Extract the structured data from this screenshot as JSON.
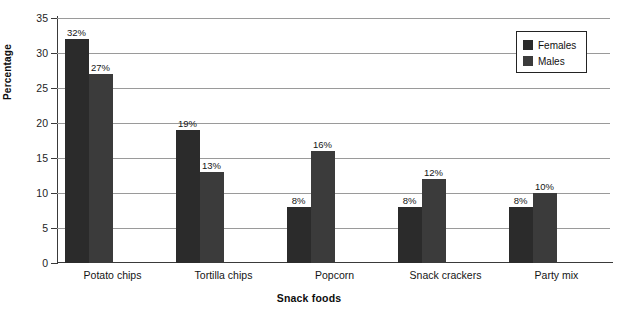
{
  "chart_data": {
    "type": "bar",
    "title": "",
    "xlabel": "Snack foods",
    "ylabel": "Percentage",
    "categories": [
      "Potato chips",
      "Tortilla chips",
      "Popcorn",
      "Snack crackers",
      "Party mix"
    ],
    "series": [
      {
        "name": "Females",
        "color": "#2b2b2b",
        "values": [
          32,
          19,
          8,
          8,
          8
        ],
        "labels": [
          "32%",
          "19%",
          "8%",
          "8%",
          "8%"
        ]
      },
      {
        "name": "Males",
        "color": "#3b3b3b",
        "values": [
          27,
          13,
          16,
          12,
          10
        ],
        "labels": [
          "27%",
          "13%",
          "16%",
          "12%",
          "10%"
        ]
      }
    ],
    "ylim": [
      0,
      35
    ],
    "ytick_labels": [
      "0",
      "5",
      "10",
      "15",
      "20",
      "25",
      "30",
      "35"
    ],
    "ytick_values": [
      0,
      5,
      10,
      15,
      20,
      25,
      30,
      35
    ],
    "grid": "horizontal",
    "legend_position": "top-right"
  },
  "legend": {
    "entries": [
      {
        "label": "Females"
      },
      {
        "label": "Males"
      }
    ]
  }
}
